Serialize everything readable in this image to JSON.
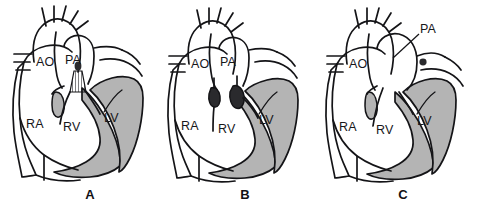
{
  "figure": {
    "background_color": "#ffffff",
    "line_color": "#141417",
    "myocardium_color": "#b4b4b4",
    "valve_color": "#2a2a2d",
    "panel_count": 3
  },
  "panels": [
    {
      "id": "A",
      "letter": "A",
      "labels": {
        "aorta": "AO",
        "pulmonary_artery": "PA",
        "right_atrium": "RA",
        "right_ventricle": "RV",
        "left_ventricle": "LV"
      },
      "feature": "hatched-wedge-below-pulmonary-artery"
    },
    {
      "id": "B",
      "letter": "B",
      "labels": {
        "aorta": "AO",
        "pulmonary_artery": "PA",
        "right_atrium": "RA",
        "right_ventricle": "RV",
        "left_ventricle": "LV"
      },
      "feature": "two-dark-valve-markers"
    },
    {
      "id": "C",
      "letter": "C",
      "labels": {
        "aorta": "AO",
        "pulmonary_artery": "PA",
        "right_atrium": "RA",
        "right_ventricle": "RV",
        "left_ventricle": "LV"
      },
      "feature": "dilated-pulmonary-artery-with-leader-line"
    }
  ]
}
